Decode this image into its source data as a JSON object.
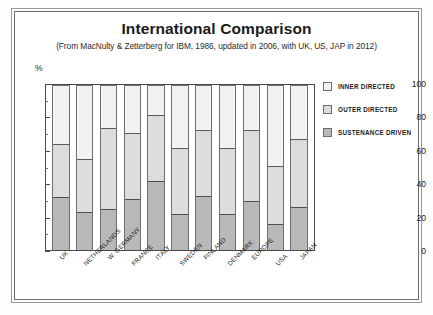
{
  "chart_data": {
    "type": "bar",
    "subtype": "stacked-percentage-column",
    "title": "International Comparison",
    "subtitle": "(From MacNulty & Zetterberg for IBM, 1986, updated in 2006, with UK, US, JAP in 2012)",
    "xlabel": "",
    "ylabel": "%",
    "ylim": [
      0,
      100
    ],
    "yticks": [
      0,
      20,
      40,
      60,
      80,
      100
    ],
    "ytick_labels": [
      "0",
      "20",
      "40",
      "60",
      "80",
      "100"
    ],
    "yminor_ticks": [
      10,
      30,
      50,
      70,
      90
    ],
    "grid": false,
    "legend_position": "right",
    "categories": [
      "UK",
      "NETHERLANDS",
      "W. GERMANY",
      "FRANCE",
      "ITALY",
      "SWEDEN",
      "FINLAND",
      "DENMARK",
      "EUROPE",
      "USA",
      "JAPAN"
    ],
    "series": [
      {
        "name": "SUSTENANCE  DRIVEN",
        "color": "#b8b8b8",
        "values": [
          32,
          23,
          25,
          31,
          42,
          22,
          33,
          22,
          30,
          16,
          26
        ]
      },
      {
        "name": "OUTER DIRECTED",
        "color": "#dcdcdc",
        "values": [
          32,
          32,
          49,
          40,
          40,
          40,
          40,
          40,
          43,
          35,
          41
        ]
      },
      {
        "name": "INNER DIRECTED",
        "color": "#f2f2f2",
        "values": [
          36,
          45,
          26,
          29,
          18,
          38,
          27,
          38,
          27,
          49,
          33
        ]
      }
    ],
    "cumulative_tops": {
      "sustenance": [
        32,
        23,
        25,
        31,
        42,
        22,
        33,
        22,
        30,
        16,
        26
      ],
      "outer": [
        64,
        55,
        74,
        71,
        82,
        62,
        73,
        62,
        73,
        51,
        67
      ],
      "inner": [
        100,
        100,
        100,
        100,
        100,
        100,
        100,
        100,
        100,
        100,
        100
      ]
    }
  },
  "legend": {
    "items": [
      {
        "label": "INNER DIRECTED",
        "color": "#f2f2f2"
      },
      {
        "label": "OUTER DIRECTED",
        "color": "#dcdcdc"
      },
      {
        "label": "SUSTENANCE  DRIVEN",
        "color": "#b8b8b8"
      }
    ]
  }
}
